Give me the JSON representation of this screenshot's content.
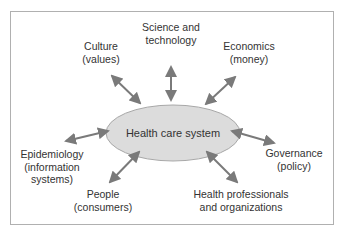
{
  "center": {
    "label": "Health care system"
  },
  "nodes": [
    {
      "id": "science",
      "line1": "Science and",
      "line2": "technology"
    },
    {
      "id": "culture",
      "line1": "Culture",
      "line2": "(values)"
    },
    {
      "id": "economics",
      "line1": "Economics",
      "line2": "(money)"
    },
    {
      "id": "epidemiology",
      "line1": "Epidemiology",
      "line2": "(information",
      "line3": "systems)"
    },
    {
      "id": "governance",
      "line1": "Governance",
      "line2": "(policy)"
    },
    {
      "id": "people",
      "line1": "People",
      "line2": "(consumers)"
    },
    {
      "id": "professionals",
      "line1": "Health professionals",
      "line2": "and organizations"
    }
  ],
  "colors": {
    "ellipse_fill": "#dcdcdc",
    "ellipse_stroke": "#a8a8a8",
    "arrow": "#7a7a7a",
    "frame": "#b0b0b0",
    "text": "#333333"
  }
}
